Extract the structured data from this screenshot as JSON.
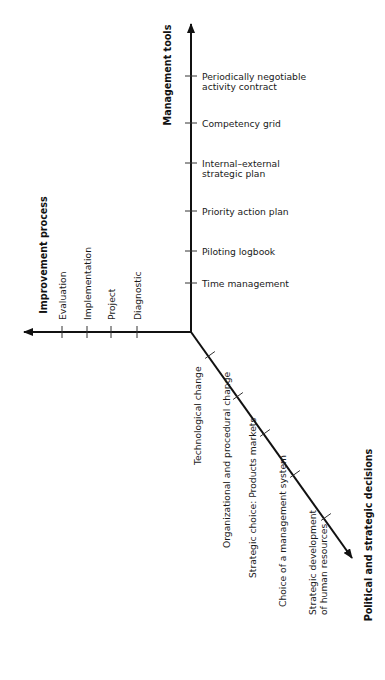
{
  "diagram": {
    "type": "three-axis concept diagram",
    "axes": {
      "management_tools": {
        "title": "Management tools",
        "direction": "up",
        "ticks": [
          [
            "Time management"
          ],
          [
            "Piloting logbook"
          ],
          [
            "Priority action plan"
          ],
          [
            "Internal–external",
            "strategic plan"
          ],
          [
            "Competency grid"
          ],
          [
            "Periodically negotiable",
            "activity contract"
          ]
        ]
      },
      "improvement_process": {
        "title": "Improvement process",
        "direction": "left",
        "ticks": [
          [
            "Diagnostic"
          ],
          [
            "Project"
          ],
          [
            "Implementation"
          ],
          [
            "Evaluation"
          ]
        ]
      },
      "political_strategic": {
        "title": "Political and strategic decisions",
        "direction": "down-right",
        "ticks": [
          [
            "Technological change"
          ],
          [
            "Organizational and procedural change"
          ],
          [
            "Strategic choice: Products markets"
          ],
          [
            "Choice of a management system"
          ],
          [
            "Strategic development",
            "of human resources"
          ]
        ]
      }
    }
  },
  "colors": {
    "line": "#111111",
    "text": "#1a1a1a",
    "background": "#ffffff"
  }
}
